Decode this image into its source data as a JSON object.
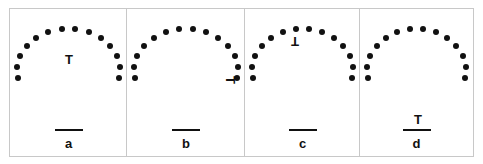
{
  "figure": {
    "panels": [
      {
        "id": "a",
        "label": "a",
        "t_glyph": "T",
        "t_rotation": 0,
        "t_pos": [
          59,
          50
        ],
        "line_has_t": false
      },
      {
        "id": "b",
        "label": "b",
        "t_glyph": "T",
        "t_rotation": 90,
        "t_pos": [
          103,
          71
        ],
        "line_has_t": false
      },
      {
        "id": "c",
        "label": "c",
        "t_glyph": "T",
        "t_rotation": 180,
        "t_pos": [
          50,
          32
        ],
        "line_has_t": false
      },
      {
        "id": "d",
        "label": "d",
        "t_glyph": "T",
        "t_rotation": 0,
        "t_pos": [
          58,
          110
        ],
        "line_has_t": true
      }
    ],
    "dots_per_arc": 14,
    "colors": {
      "ink": "#111111",
      "border": "#c8c8c8",
      "background": "#ffffff"
    }
  }
}
